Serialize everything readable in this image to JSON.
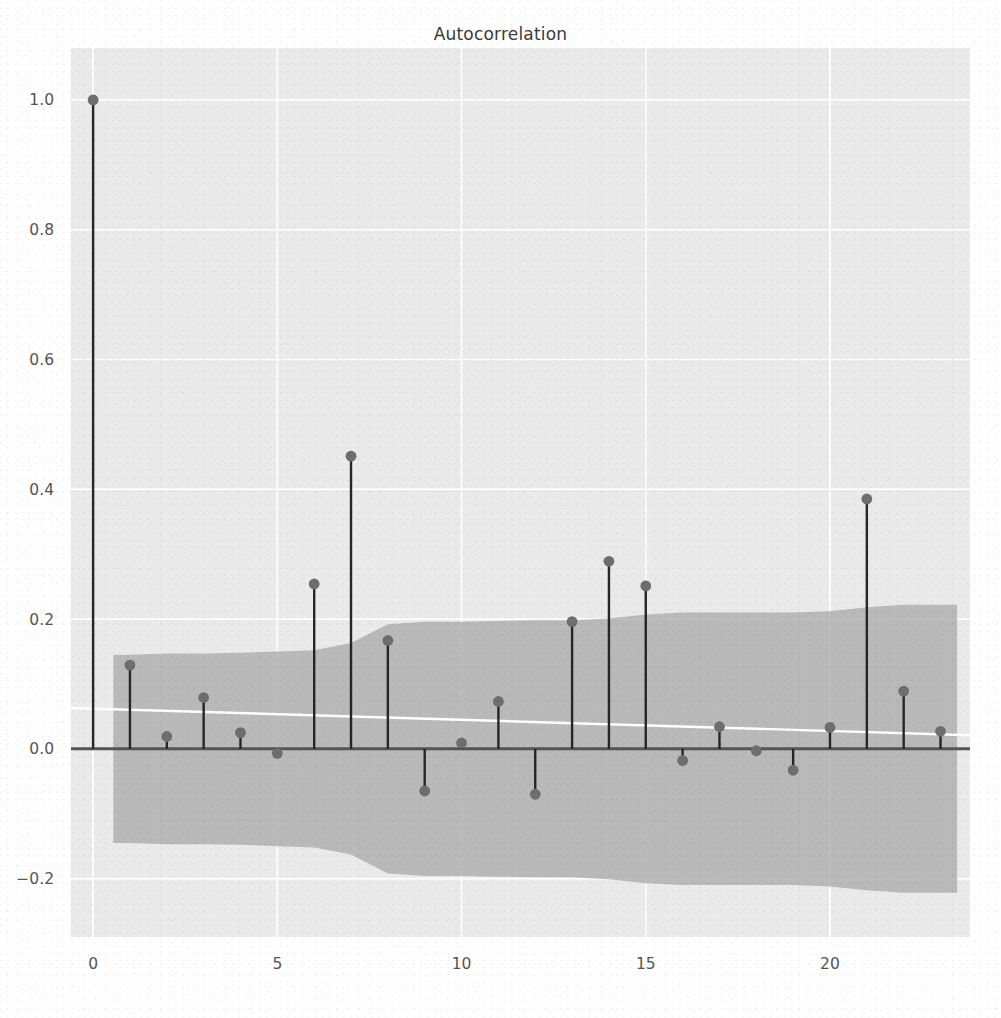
{
  "figure": {
    "title": "Autocorrelation",
    "background_color": "#ffffff",
    "axes_background_color": "#eaeaea",
    "grid_color": "#ffffff",
    "stem_color": "#262626",
    "marker_color": "#6e6e6e",
    "band_color": "#b0b0b0",
    "trend_line_color": "#ffffff",
    "zero_line_color": "#555555"
  },
  "axes": {
    "x_ticks": [
      "0",
      "5",
      "10",
      "15",
      "20"
    ],
    "x_tick_values": [
      0,
      5,
      10,
      15,
      20
    ],
    "y_ticks": [
      "1.0",
      "0.8",
      "0.6",
      "0.4",
      "0.2",
      "0.0",
      "−0.2"
    ],
    "y_tick_values": [
      1.0,
      0.8,
      0.6,
      0.4,
      0.2,
      0.0,
      -0.2
    ],
    "xlim": [
      -0.6,
      23.8
    ],
    "ylim": [
      -0.29,
      1.08
    ],
    "xlabel": "",
    "ylabel": ""
  },
  "chart_data": {
    "type": "line",
    "subtype": "stem-autocorrelation",
    "title": "Autocorrelation",
    "xlabel": "",
    "ylabel": "",
    "xlim": [
      -0.6,
      23.8
    ],
    "ylim": [
      -0.29,
      1.08
    ],
    "grid": true,
    "legend": null,
    "x": [
      0,
      1,
      2,
      3,
      4,
      5,
      6,
      7,
      8,
      9,
      10,
      11,
      12,
      13,
      14,
      15,
      16,
      17,
      18,
      19,
      20,
      21,
      22,
      23
    ],
    "values": [
      1.0,
      0.129,
      0.019,
      0.079,
      0.025,
      -0.007,
      0.254,
      0.451,
      0.167,
      -0.065,
      0.009,
      0.073,
      -0.07,
      0.196,
      0.289,
      0.251,
      -0.018,
      0.034,
      -0.003,
      -0.033,
      0.033,
      0.385,
      0.089,
      0.027
    ],
    "series": [
      {
        "name": "autocorrelation",
        "values": [
          1.0,
          0.129,
          0.019,
          0.079,
          0.025,
          -0.007,
          0.254,
          0.451,
          0.167,
          -0.065,
          0.009,
          0.073,
          -0.07,
          0.196,
          0.289,
          0.251,
          -0.018,
          0.034,
          -0.003,
          -0.033,
          0.033,
          0.385,
          0.089,
          0.027
        ]
      }
    ],
    "confidence_band": {
      "name": "95% confidence interval",
      "x": [
        0.55,
        1,
        2,
        3,
        4,
        5,
        6,
        7,
        8,
        9,
        10,
        11,
        12,
        13,
        14,
        15,
        16,
        17,
        18,
        19,
        20,
        21,
        22,
        23,
        23.45
      ],
      "upper": [
        0.145,
        0.145,
        0.147,
        0.147,
        0.148,
        0.15,
        0.152,
        0.163,
        0.192,
        0.196,
        0.196,
        0.197,
        0.198,
        0.198,
        0.201,
        0.207,
        0.21,
        0.21,
        0.21,
        0.21,
        0.212,
        0.218,
        0.222,
        0.222,
        0.222
      ],
      "lower": [
        -0.145,
        -0.145,
        -0.147,
        -0.147,
        -0.148,
        -0.15,
        -0.152,
        -0.163,
        -0.192,
        -0.196,
        -0.196,
        -0.197,
        -0.198,
        -0.198,
        -0.201,
        -0.207,
        -0.21,
        -0.21,
        -0.21,
        -0.21,
        -0.212,
        -0.218,
        -0.222,
        -0.222,
        -0.222
      ]
    },
    "trend_line": {
      "name": "trend",
      "x": [
        -0.6,
        23.8
      ],
      "y": [
        0.063,
        0.021
      ]
    },
    "zero_line": 0.0
  }
}
